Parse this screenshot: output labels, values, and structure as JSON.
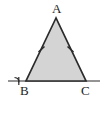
{
  "figure": {
    "kind": "isosceles-triangle-diagram",
    "background_color": "#ffffff",
    "stroke_color": "#2b2b2b",
    "fill_color": "#d4d4d4",
    "label_color": "#1c1c1c"
  },
  "labels": {
    "apex": "A",
    "base_left": "B",
    "base_right": "C"
  },
  "vertices": {
    "A": {
      "x": 56,
      "y": 18
    },
    "B": {
      "x": 26,
      "y": 81
    },
    "C": {
      "x": 86,
      "y": 81
    }
  },
  "base_line": {
    "x_start": 8,
    "x_end": 100,
    "y": 81,
    "extends_past_B": true,
    "extends_past_C": true
  },
  "congruence_ticks": {
    "count_per_side": 1,
    "sides": [
      "AB",
      "AC"
    ],
    "left_tick": {
      "x": 41,
      "y": 49
    },
    "right_tick": {
      "x": 71,
      "y": 49
    }
  },
  "angle_mark": {
    "at_vertex": "B",
    "type": "exterior-angle-arc",
    "x": 17,
    "y": 78
  }
}
